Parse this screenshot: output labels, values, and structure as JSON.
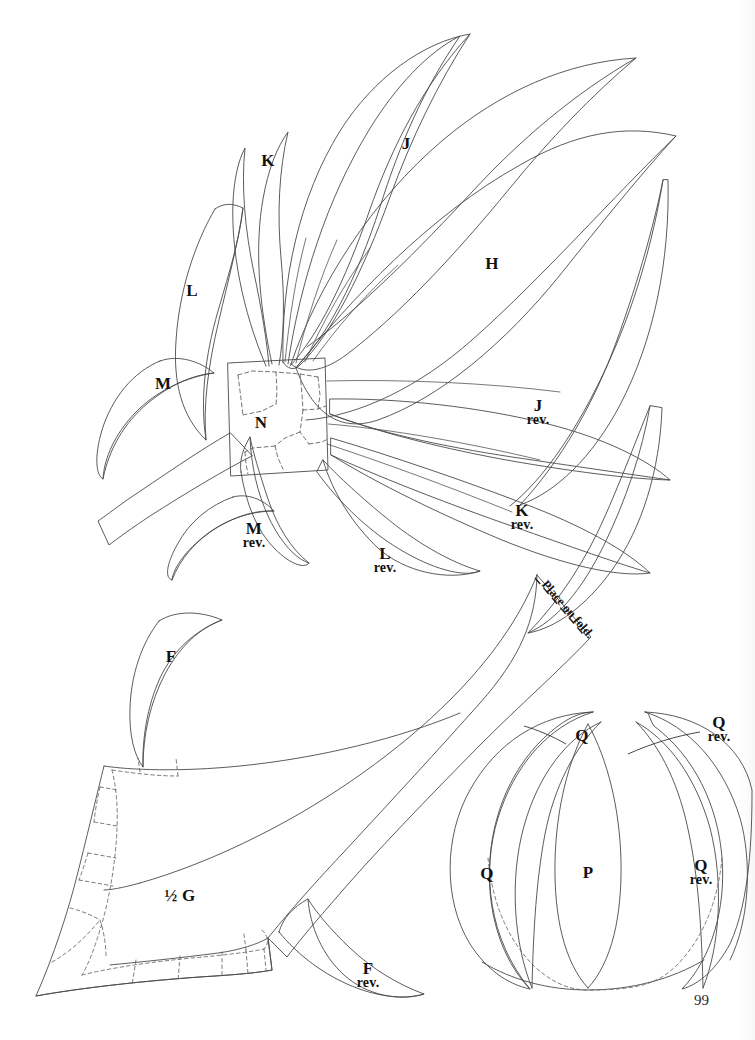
{
  "page": {
    "page_number": "99",
    "background_color": "#ffffff",
    "line_color": "#4a4a4a",
    "label_color": "#111111"
  },
  "annotations": {
    "place_on_fold": "Place on fold."
  },
  "pieces": [
    {
      "id": "K",
      "main": "K",
      "sub": "",
      "x": 268,
      "y": 161
    },
    {
      "id": "J",
      "main": "J",
      "sub": "",
      "x": 406,
      "y": 144
    },
    {
      "id": "H",
      "main": "H",
      "sub": "",
      "x": 492,
      "y": 264
    },
    {
      "id": "L",
      "main": "L",
      "sub": "",
      "x": 192,
      "y": 291
    },
    {
      "id": "M",
      "main": "M",
      "sub": "",
      "x": 163,
      "y": 384
    },
    {
      "id": "N",
      "main": "N",
      "sub": "",
      "x": 261,
      "y": 423
    },
    {
      "id": "Jrev",
      "main": "J",
      "sub": "rev.",
      "x": 538,
      "y": 412
    },
    {
      "id": "Krev",
      "main": "K",
      "sub": "rev.",
      "x": 522,
      "y": 517
    },
    {
      "id": "Mrev",
      "main": "M",
      "sub": "rev.",
      "x": 254,
      "y": 535
    },
    {
      "id": "Lrev",
      "main": "L",
      "sub": "rev.",
      "x": 385,
      "y": 560
    },
    {
      "id": "F",
      "main": "F",
      "sub": "",
      "x": 171,
      "y": 657
    },
    {
      "id": "halfG",
      "main": "½ G",
      "sub": "",
      "x": 180,
      "y": 896
    },
    {
      "id": "Frev",
      "main": "F",
      "sub": "rev.",
      "x": 368,
      "y": 975
    },
    {
      "id": "Qtop",
      "main": "Q",
      "sub": "",
      "x": 582,
      "y": 736
    },
    {
      "id": "Qrevtop",
      "main": "Q",
      "sub": "rev.",
      "x": 719,
      "y": 729
    },
    {
      "id": "Qleft",
      "main": "Q",
      "sub": "",
      "x": 487,
      "y": 874
    },
    {
      "id": "P",
      "main": "P",
      "sub": "",
      "x": 588,
      "y": 873
    },
    {
      "id": "Qrevright",
      "main": "Q",
      "sub": "rev.",
      "x": 701,
      "y": 872
    }
  ]
}
